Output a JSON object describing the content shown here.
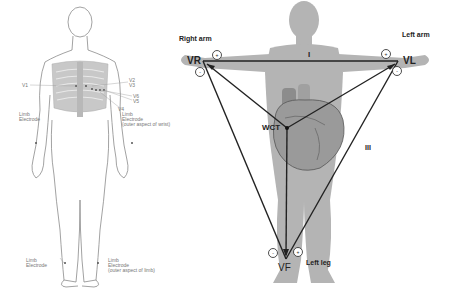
{
  "left_figure": {
    "chest_leads": [
      "V1",
      "V2",
      "V3",
      "V4",
      "V5",
      "V6"
    ],
    "labels": {
      "v1": "V1",
      "v2_v3": "V2\nV3",
      "v6": "V6",
      "v5": "V5",
      "v4": "V4",
      "limb_electrode_left": "Limb\nElectrode",
      "limb_electrode_wrist": "Limb\nElectrode\n(outer aspect of wrist)",
      "limb_electrode_leg_left": "Limb\nElectrode",
      "limb_electrode_leg_right": "Limb\nElectrode\n(outer aspect of limb)"
    }
  },
  "right_figure": {
    "limb_labels": {
      "right_arm": "Right arm",
      "left_arm": "Left arm",
      "left_leg": "Left leg"
    },
    "electrodes": {
      "vr": "VR",
      "vl": "VL",
      "vf": "VF",
      "wct": "WCT"
    },
    "leads": {
      "lead_1": "I",
      "lead_3": "III"
    },
    "polarity_signs": [
      "+",
      "-",
      "+",
      "-",
      "-",
      "+"
    ],
    "colors": {
      "body": "#b4b4b4",
      "heart": "#9a9a9a",
      "lines": "#222222"
    }
  }
}
